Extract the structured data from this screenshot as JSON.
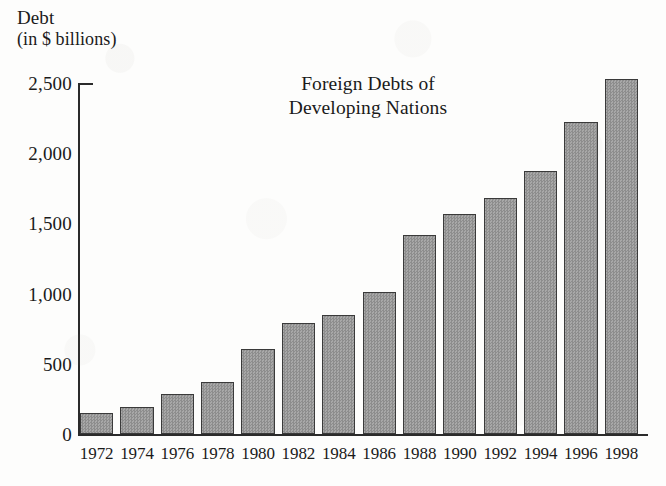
{
  "chart_data": {
    "type": "bar",
    "title": "Foreign Debts of\nDeveloping Nations",
    "title_line1": "Foreign Debts of",
    "title_line2": "Developing Nations",
    "ylabel_line1": "Debt",
    "ylabel_line2": "(in $ billions)",
    "xlabel": "",
    "categories": [
      "1972",
      "1974",
      "1976",
      "1978",
      "1980",
      "1982",
      "1984",
      "1986",
      "1988",
      "1990",
      "1992",
      "1994",
      "1996",
      "1998"
    ],
    "values": [
      150,
      195,
      285,
      370,
      605,
      790,
      850,
      1010,
      1415,
      1570,
      1680,
      1875,
      2225,
      2530
    ],
    "ylim": [
      0,
      2500
    ],
    "yticks": [
      0,
      500,
      1000,
      1500,
      2000,
      2500
    ],
    "ytick_labels": [
      "0",
      "500",
      "1,000",
      "1,500",
      "2,000",
      "2,500"
    ],
    "grid": false,
    "legend": null,
    "bar_fill_color": "#9a9a9a",
    "bar_edge_color": "#3a3a3a",
    "axis_color": "#2b2b2b",
    "background_color": "#fdfdfc"
  }
}
